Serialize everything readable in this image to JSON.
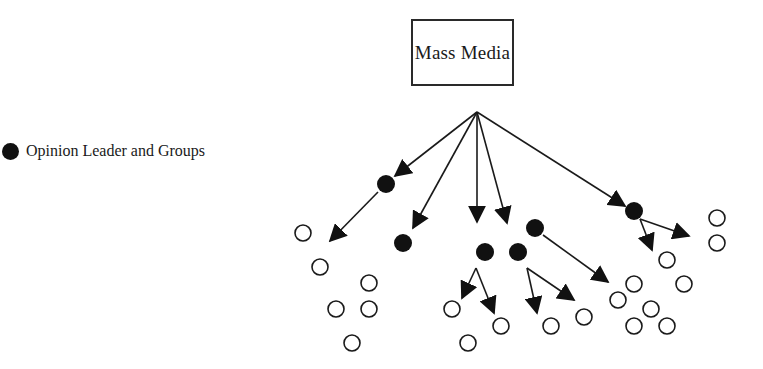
{
  "source_node": {
    "label": "Mass Media"
  },
  "legend": {
    "symbol": "filled-circle",
    "label": "Opinion Leader and Groups"
  },
  "colors": {
    "stroke": "#1a1a1a",
    "fill_leader": "#111111",
    "fill_follower": "#ffffff"
  },
  "origin": [
    477,
    112
  ],
  "leaders": [
    {
      "id": "L1",
      "x": 386,
      "y": 184
    },
    {
      "id": "L2",
      "x": 403,
      "y": 243
    },
    {
      "id": "L3",
      "x": 485,
      "y": 252
    },
    {
      "id": "L4",
      "x": 518,
      "y": 252
    },
    {
      "id": "L5",
      "x": 535,
      "y": 228
    },
    {
      "id": "L6",
      "x": 634,
      "y": 211
    }
  ],
  "followers": [
    {
      "x": 303,
      "y": 233
    },
    {
      "x": 320,
      "y": 267
    },
    {
      "x": 369,
      "y": 283
    },
    {
      "x": 336,
      "y": 309
    },
    {
      "x": 369,
      "y": 309
    },
    {
      "x": 352,
      "y": 343
    },
    {
      "x": 452,
      "y": 309
    },
    {
      "x": 501,
      "y": 326
    },
    {
      "x": 468,
      "y": 343
    },
    {
      "x": 551,
      "y": 326
    },
    {
      "x": 584,
      "y": 317
    },
    {
      "x": 618,
      "y": 300
    },
    {
      "x": 634,
      "y": 284
    },
    {
      "x": 651,
      "y": 309
    },
    {
      "x": 634,
      "y": 326
    },
    {
      "x": 667,
      "y": 326
    },
    {
      "x": 684,
      "y": 284
    },
    {
      "x": 667,
      "y": 260
    },
    {
      "x": 717,
      "y": 218
    },
    {
      "x": 717,
      "y": 243
    }
  ],
  "arrows": [
    {
      "from": [
        477,
        112
      ],
      "to": [
        395,
        176
      ]
    },
    {
      "from": [
        477,
        112
      ],
      "to": [
        413,
        228
      ]
    },
    {
      "from": [
        477,
        112
      ],
      "to": [
        477,
        222
      ]
    },
    {
      "from": [
        477,
        112
      ],
      "to": [
        507,
        223
      ]
    },
    {
      "from": [
        477,
        112
      ],
      "to": [
        625,
        206
      ]
    },
    {
      "from": [
        378,
        192
      ],
      "to": [
        330,
        241
      ]
    },
    {
      "from": [
        476,
        268
      ],
      "to": [
        462,
        298
      ]
    },
    {
      "from": [
        476,
        268
      ],
      "to": [
        494,
        313
      ]
    },
    {
      "from": [
        527,
        268
      ],
      "to": [
        537,
        313
      ]
    },
    {
      "from": [
        527,
        268
      ],
      "to": [
        574,
        300
      ]
    },
    {
      "from": [
        543,
        235
      ],
      "to": [
        608,
        282
      ]
    },
    {
      "from": [
        640,
        219
      ],
      "to": [
        689,
        236
      ]
    },
    {
      "from": [
        640,
        219
      ],
      "to": [
        652,
        250
      ]
    }
  ]
}
